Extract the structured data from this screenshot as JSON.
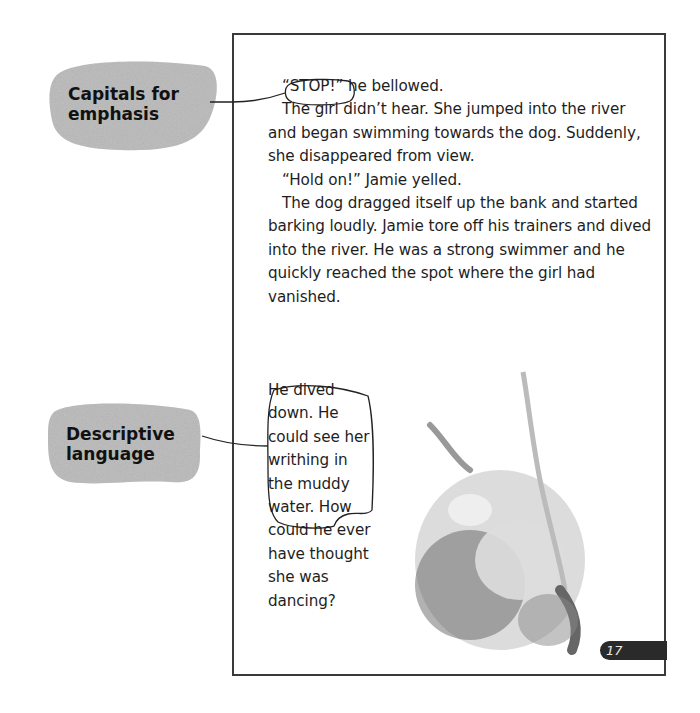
{
  "callouts": [
    {
      "id": "capitals",
      "lines": [
        "Capitals for",
        "emphasis"
      ]
    },
    {
      "id": "descriptive",
      "lines": [
        "Descriptive",
        "language"
      ]
    }
  ],
  "story": {
    "highlighted_word": "“STOP!”",
    "line1_rest": " he bellowed.",
    "para2": "The girl didn’t hear. She jumped into the river and began swimming towards the dog. Suddenly, she disappeared from view.",
    "para3": "“Hold on!” Jamie yelled.",
    "para4": "The dog dragged itself up the bank and started barking loudly. Jamie tore off his trainers and dived into the river. He was a strong swimmer and he quickly reached the spot where the girl had vanished.",
    "narrow_lines": [
      "He dived",
      "down. He",
      "could see her",
      "writhing in",
      "the muddy",
      "water.",
      "How",
      "could he ever",
      "have thought",
      "she was",
      "dancing?"
    ]
  },
  "illustration": {
    "description": "girl-underwater-illustration"
  },
  "page_number": "17",
  "colors": {
    "callout_fill": "#b9b9b9",
    "ink": "#1e1e1e",
    "tab": "#2a2a2a"
  }
}
